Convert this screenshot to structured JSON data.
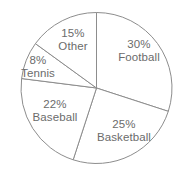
{
  "chart_data": {
    "type": "pie",
    "title": "",
    "xlabel": "",
    "ylabel": "",
    "units": "percent",
    "total": 100,
    "start_angle_deg": 0,
    "direction": "clockwise",
    "grid": false,
    "legend": "none",
    "labels_inside": true,
    "categories": [
      "Football",
      "Basketball",
      "Baseball",
      "Tennis",
      "Other"
    ],
    "values": [
      30,
      25,
      22,
      8,
      15
    ],
    "slices": [
      {
        "category": "Football",
        "value": 30,
        "percent_text": "30%",
        "start_deg": 0,
        "end_deg": 108,
        "label_x": 139,
        "label_y": 50
      },
      {
        "category": "Basketball",
        "value": 25,
        "percent_text": "25%",
        "start_deg": 108,
        "end_deg": 198,
        "label_x": 124,
        "label_y": 130
      },
      {
        "category": "Baseball",
        "value": 22,
        "percent_text": "22%",
        "start_deg": 198,
        "end_deg": 277.2,
        "label_x": 55,
        "label_y": 110
      },
      {
        "category": "Tennis",
        "value": 8,
        "percent_text": "8%",
        "start_deg": 277.2,
        "end_deg": 306,
        "label_x": 38,
        "label_y": 66
      },
      {
        "category": "Other",
        "value": 15,
        "percent_text": "15%",
        "start_deg": 306,
        "end_deg": 360,
        "label_x": 73,
        "label_y": 39
      }
    ],
    "geometry": {
      "center_x": 96.5,
      "center_y": 88,
      "radius": 75.5
    },
    "colors": {
      "background": "#ffffff",
      "slice_fill": "#ffffff",
      "slice_stroke": "#8d8d8d",
      "label_text": "#6b6b6b"
    }
  }
}
